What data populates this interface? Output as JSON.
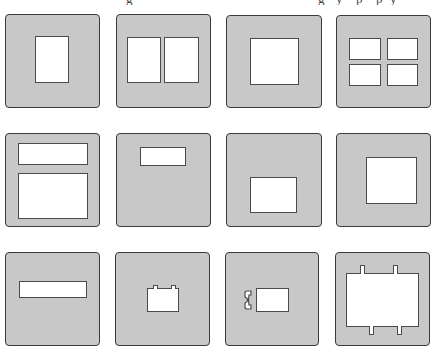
{
  "figure": {
    "caption_fragment_visible": "descenders of a cropped caption line (illegible)",
    "colors": {
      "mount": "#c8c8c8",
      "outline": "#3a3a3a",
      "window": "#ffffff"
    }
  },
  "panels": [
    {
      "id": 1,
      "label": "single vertical aperture"
    },
    {
      "id": 2,
      "label": "two vertical apertures side by side"
    },
    {
      "id": 3,
      "label": "large square aperture"
    },
    {
      "id": 4,
      "label": "four small apertures 2x2"
    },
    {
      "id": 5,
      "label": "wide strip above large aperture"
    },
    {
      "id": 6,
      "label": "small strip aperture near top"
    },
    {
      "id": 7,
      "label": "small aperture lower center"
    },
    {
      "id": 8,
      "label": "square aperture right of center"
    },
    {
      "id": 9,
      "label": "long horizontal strip aperture"
    },
    {
      "id": 10,
      "label": "small aperture with two top notches"
    },
    {
      "id": 11,
      "label": "small aperture with side clip notch"
    },
    {
      "id": 12,
      "label": "large aperture with four tab notches"
    }
  ]
}
